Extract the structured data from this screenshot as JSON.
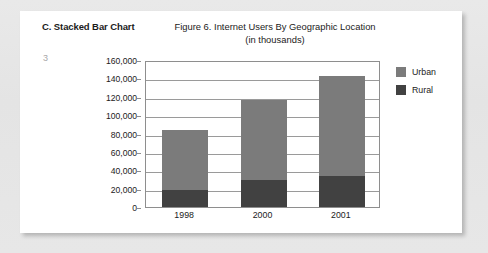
{
  "section": {
    "heading": "C. Stacked Bar Chart",
    "page_marker": "3"
  },
  "legend": {
    "position": "right",
    "entries": [
      {
        "label": "Urban",
        "color": "#7b7b7b"
      },
      {
        "label": "Rural",
        "color": "#414141"
      }
    ]
  },
  "colors": {
    "urban": "#7b7b7b",
    "rural": "#414141",
    "axis": "#8e8e8e",
    "grid": "#9a9a9a",
    "page": "#ffffff",
    "backdrop": "#e7e7e7",
    "text": "#1b1b1b",
    "page_marker": "#a8a8a8"
  },
  "chart_data": {
    "type": "bar",
    "stacked": true,
    "title": "Figure 6. Internet Users By Geographic Location",
    "subtitle": "(in thousands)",
    "xlabel": "",
    "ylabel": "",
    "categories": [
      "1998",
      "2000",
      "2001"
    ],
    "series": [
      {
        "name": "Rural",
        "color": "#414141",
        "values": [
          18000,
          29000,
          34000
        ]
      },
      {
        "name": "Urban",
        "color": "#7b7b7b",
        "values": [
          66000,
          88000,
          109000
        ]
      }
    ],
    "totals": [
      84000,
      117000,
      143000
    ],
    "ylim": [
      0,
      160000
    ],
    "ytick_step": 20000,
    "ytick_labels": [
      "160,000",
      "140,000",
      "120,000",
      "100,000",
      "80,000",
      "60,000",
      "40,000",
      "20,000",
      "0"
    ],
    "ytick_values": [
      160000,
      140000,
      120000,
      100000,
      80000,
      60000,
      40000,
      20000,
      0
    ],
    "grid": true,
    "legend_position": "right"
  }
}
